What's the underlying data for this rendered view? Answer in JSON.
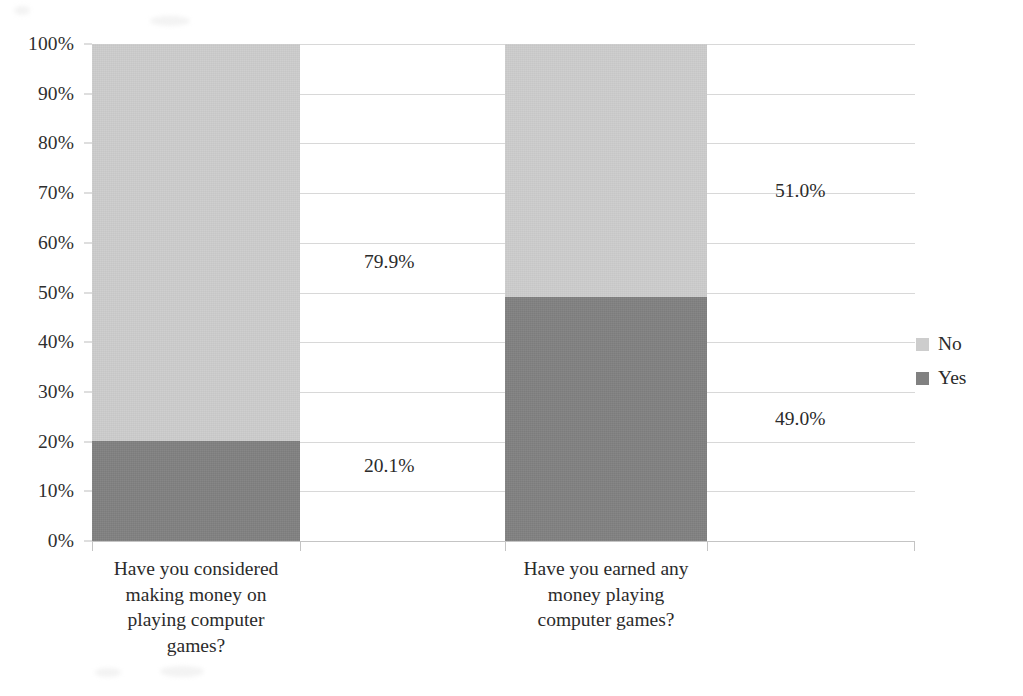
{
  "chart_data": {
    "type": "bar",
    "subtype": "stacked-100-percent",
    "title": "",
    "xlabel": "",
    "ylabel": "",
    "ylim": [
      0,
      100
    ],
    "y_tick_labels": [
      "100%",
      "90%",
      "80%",
      "70%",
      "60%",
      "50%",
      "40%",
      "30%",
      "20%",
      "10%",
      "0%"
    ],
    "y_tick_values": [
      100,
      90,
      80,
      70,
      60,
      50,
      40,
      30,
      20,
      10,
      0
    ],
    "grid": true,
    "legend_position": "right",
    "categories": [
      "Have you considered making money on playing computer games?",
      "Have you earned any money playing computer games?"
    ],
    "category_lines": [
      [
        "Have you considered",
        "making money on",
        "playing computer",
        "games?"
      ],
      [
        "Have you earned any",
        "money playing",
        "computer games?"
      ]
    ],
    "series": [
      {
        "name": "Yes",
        "color": "#818181",
        "values": [
          20.1,
          49.0
        ],
        "labels": [
          "20.1%",
          "49.0%"
        ]
      },
      {
        "name": "No",
        "color": "#cdcdcd",
        "values": [
          79.9,
          51.0
        ],
        "labels": [
          "79.9%",
          "51.0%"
        ]
      }
    ],
    "data_labels": [
      "20.1%",
      "79.9%",
      "49.0%",
      "51.0%"
    ]
  },
  "legend": {
    "items": [
      {
        "label": "No",
        "color": "#cdcdcd"
      },
      {
        "label": "Yes",
        "color": "#818181"
      }
    ]
  },
  "colors": {
    "no": "#cdcdcd",
    "yes": "#818181",
    "gridline": "#d8d8d8",
    "axis": "#c4c4c4",
    "text": "#2b2b2b",
    "background": "#ffffff"
  }
}
